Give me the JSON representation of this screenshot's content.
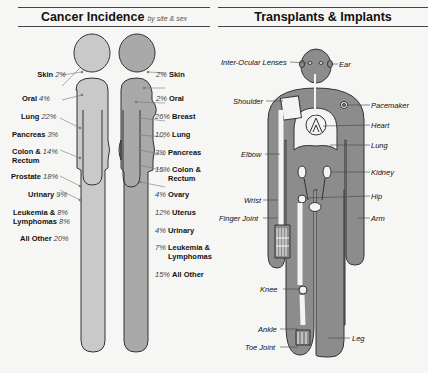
{
  "left_panel": {
    "title": "Cancer Incidence",
    "subtitle": "by site & sex",
    "male": [
      {
        "site": "Skin",
        "pct": "2%"
      },
      {
        "site": "Oral",
        "pct": "4%"
      },
      {
        "site": "Lung",
        "pct": "22%"
      },
      {
        "site": "Pancreas",
        "pct": "3%"
      },
      {
        "site": "Colon & Rectum",
        "site_l1": "Colon &",
        "site_l2": "Rectum",
        "pct": "14%"
      },
      {
        "site": "Prostate",
        "pct": "18%"
      },
      {
        "site": "Urinary",
        "pct": "9%"
      },
      {
        "site": "Leukemia & Lymphomas",
        "site_l1": "Leukemia &",
        "site_l2": "Lymphomas",
        "pct_l1": "8%",
        "pct_l2": "8%"
      },
      {
        "site": "All Other",
        "pct": "20%"
      }
    ],
    "female": [
      {
        "site": "Skin",
        "pct": "2%"
      },
      {
        "site": "Oral",
        "pct": "2%"
      },
      {
        "site": "Breast",
        "pct": "26%"
      },
      {
        "site": "Lung",
        "pct": "10%"
      },
      {
        "site": "Pancreas",
        "pct": "3%"
      },
      {
        "site": "Colon & Rectum",
        "site_l1": "Colon &",
        "site_l2": "Rectum",
        "pct": "15%"
      },
      {
        "site": "Ovary",
        "pct": "4%"
      },
      {
        "site": "Uterus",
        "pct": "12%"
      },
      {
        "site": "Urinary",
        "pct": "4%"
      },
      {
        "site": "Leukemia & Lymphomas",
        "site_l1": "Leukemia &",
        "site_l2": "Lymphomas",
        "pct": "7%"
      },
      {
        "site": "All Other",
        "pct": "15%"
      }
    ],
    "colors": {
      "male": "#c9c9c9",
      "female": "#a9a9a9",
      "outline": "#333333"
    }
  },
  "right_panel": {
    "title": "Transplants & Implants",
    "labels_left": [
      "Inter-Ocular Lenses",
      "Shoulder",
      "Elbow",
      "Wrist",
      "Finger Joint",
      "Knee",
      "Ankle",
      "Toe Joint"
    ],
    "labels_right": [
      "Ear",
      "Pacemaker",
      "Heart",
      "Lung",
      "Kidney",
      "Hip",
      "Arm",
      "Leg"
    ],
    "colors": {
      "body": "#8c8c8c",
      "implant": "#f4f4f4",
      "outline": "#333333"
    }
  }
}
